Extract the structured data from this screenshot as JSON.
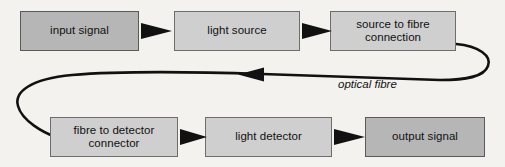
{
  "diagram": {
    "background_color": "#f3f2ef",
    "node_fill_light": "#cfcfcf",
    "node_fill_dark": "#b6b6b6",
    "node_border_color": "#6d6d6d",
    "line_color": "#111111",
    "nodes": [
      {
        "id": "input-signal",
        "label": "input signal",
        "shade": "dark",
        "row": "top",
        "x": 20,
        "y": 11,
        "w": 119,
        "h": 40
      },
      {
        "id": "light-source",
        "label": "light source",
        "shade": "light",
        "row": "top",
        "x": 174,
        "y": 11,
        "w": 126,
        "h": 40
      },
      {
        "id": "source-to-fibre",
        "label": "source to fibre connection",
        "line1": "source to fibre",
        "line2": "connection",
        "shade": "light",
        "row": "top",
        "x": 330,
        "y": 11,
        "w": 126,
        "h": 40
      },
      {
        "id": "fibre-to-detector",
        "label": "fibre to detector connector",
        "line1": "fibre to detector",
        "line2": "connector",
        "shade": "light",
        "row": "bottom",
        "x": 50,
        "y": 117,
        "w": 128,
        "h": 40
      },
      {
        "id": "light-detector",
        "label": "light detector",
        "shade": "light",
        "row": "bottom",
        "x": 205,
        "y": 117,
        "w": 127,
        "h": 40
      },
      {
        "id": "output-signal",
        "label": "output signal",
        "shade": "dark",
        "row": "bottom",
        "x": 365,
        "y": 117,
        "w": 120,
        "h": 40
      }
    ],
    "arrows": [
      {
        "id": "arrow-input-to-source",
        "from": "input-signal",
        "to": "light-source",
        "direction": "right",
        "x1": 141,
        "x2": 172,
        "y": 31
      },
      {
        "id": "arrow-source-to-connection",
        "from": "light-source",
        "to": "source-to-fibre",
        "direction": "right",
        "x1": 302,
        "x2": 329,
        "y": 31
      },
      {
        "id": "arrow-connector-to-detector",
        "from": "fibre-to-detector",
        "to": "light-detector",
        "direction": "right",
        "x1": 180,
        "x2": 204,
        "y": 137
      },
      {
        "id": "arrow-detector-to-output",
        "from": "light-detector",
        "to": "output-signal",
        "direction": "right",
        "x1": 334,
        "x2": 364,
        "y": 137
      }
    ],
    "fibre": {
      "id": "optical-fibre-path",
      "label": "optical fibre",
      "label_x": 338,
      "label_y": 85,
      "direction": "right-to-left",
      "arrowhead_x": 238,
      "arrowhead_y": 74,
      "stroke_width": 2.6
    }
  }
}
